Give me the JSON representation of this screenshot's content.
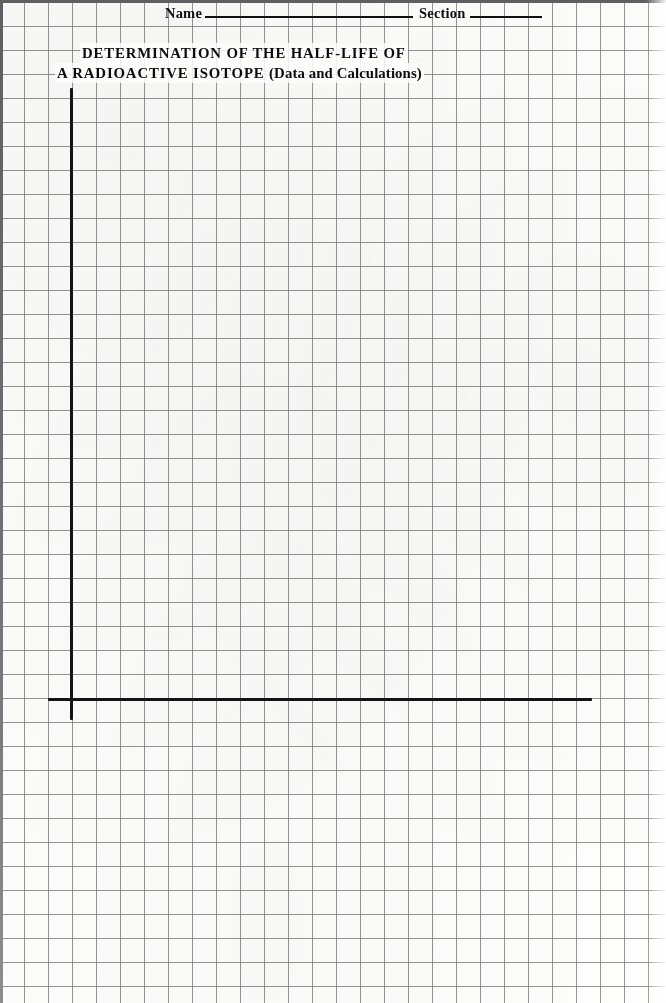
{
  "page": {
    "width": 666,
    "height": 1003,
    "paper_color": "#fdfdfc",
    "grid_line_color": "#787a7e",
    "ink_color": "#141417",
    "grid_spacing_px": 24
  },
  "header": {
    "name_label": "Name",
    "section_label": "Section",
    "name_rule": "",
    "section_rule": ""
  },
  "title": {
    "line1": "DETERMINATION OF THE HALF-LIFE OF",
    "line2_main": "A RADIOACTIVE ISOTOPE",
    "line2_parenthetical": "(Data and Calculations)"
  },
  "chart_data": {
    "type": "line",
    "subtitle": "",
    "xlabel": "",
    "ylabel": "",
    "categories": [],
    "values": [],
    "series": [],
    "annotations": [
      "Blank graph-paper worksheet: axes drawn, no data plotted"
    ],
    "grid": true,
    "grid_spacing_px": 24,
    "legend": "none",
    "axes": {
      "y_axis": {
        "drawn": true,
        "x_px": 71,
        "top_px": 88,
        "bottom_px": 720,
        "ticks": [],
        "tick_labels": []
      },
      "x_axis": {
        "drawn": true,
        "y_px": 699,
        "left_px": 48,
        "right_px": 592,
        "ticks": [],
        "tick_labels": []
      }
    },
    "xlim": [
      null,
      null
    ],
    "ylim": [
      null,
      null
    ],
    "data_points": []
  }
}
